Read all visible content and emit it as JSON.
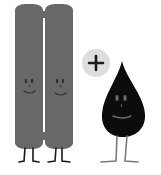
{
  "illustration": {
    "description": "Two gray pillar characters plus a black drop character",
    "characters": [
      {
        "name": "pillar-left",
        "color": "#686868",
        "expression": "smile"
      },
      {
        "name": "pillar-right",
        "color": "#686868",
        "expression": "smile"
      },
      {
        "name": "drop",
        "color": "#0c0c0c",
        "expression": "smile"
      }
    ],
    "operator": {
      "symbol": "+",
      "circle_color": "#dedede",
      "symbol_color": "#1a1a1a"
    },
    "colors": {
      "pillar": "#686868",
      "pillar_face": "#2e2e2e",
      "drop": "#0c0c0c",
      "drop_face": "#6a6a6a",
      "legs": "#1a1a1a",
      "drop_legs": "#7a7a7a",
      "background": "#ffffff"
    }
  }
}
